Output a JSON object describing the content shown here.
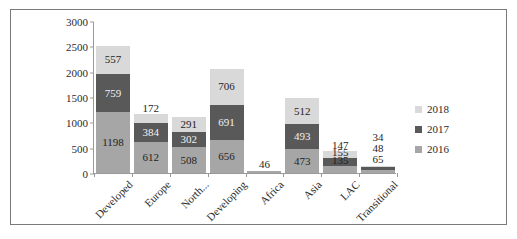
{
  "chart_data": {
    "type": "bar",
    "subtype": "stacked-column",
    "title": "",
    "xlabel": "",
    "ylabel": "",
    "ylim": [
      0,
      3000
    ],
    "yticks": [
      0,
      500,
      1000,
      1500,
      2000,
      2500,
      3000
    ],
    "grid": false,
    "legend_position": "right",
    "categories": [
      "Developed",
      "Europe",
      "North...",
      "Developing",
      "Africa",
      "Asia",
      "LAC",
      "Transitional"
    ],
    "series": [
      {
        "name": "2016",
        "color": "#a6a6a6",
        "values": [
          1198,
          612,
          508,
          656,
          46,
          473,
          135,
          65
        ]
      },
      {
        "name": "2017",
        "color": "#595959",
        "values": [
          759,
          384,
          302,
          691,
          0,
          493,
          155,
          48
        ]
      },
      {
        "name": "2018",
        "color": "#d9d9d9",
        "values": [
          557,
          172,
          291,
          706,
          0,
          512,
          147,
          34
        ]
      }
    ],
    "stack_order_bottom_to_top": [
      "2016",
      "2017",
      "2018"
    ],
    "data_labels": {
      "Developed": {
        "2016": "1198",
        "2017": "759",
        "2018": "557"
      },
      "Europe": {
        "2016": "612",
        "2017": "384",
        "2018": "172"
      },
      "North...": {
        "2016": "508",
        "2017": "302",
        "2018": "291"
      },
      "Developing": {
        "2016": "656",
        "2017": "691",
        "2018": "706"
      },
      "Africa": {
        "2016": "46"
      },
      "Asia": {
        "2016": "473",
        "2017": "493",
        "2018": "512"
      },
      "LAC": {
        "2016": "135",
        "2017": "155",
        "2018": "147"
      },
      "Transitional": {
        "2016": "65",
        "2017": "48",
        "2018": "34"
      }
    }
  },
  "legend": {
    "items": [
      {
        "label": "2018",
        "color": "#d9d9d9"
      },
      {
        "label": "2017",
        "color": "#595959"
      },
      {
        "label": "2016",
        "color": "#a6a6a6"
      }
    ]
  },
  "axis": {
    "y_tick_labels": [
      "3000",
      "2500",
      "2000",
      "1500",
      "1000",
      "500",
      "0"
    ],
    "x_tick_labels": [
      "Developed",
      "Europe",
      "North...",
      "Developing",
      "Africa",
      "Asia",
      "LAC",
      "Transitional"
    ]
  }
}
